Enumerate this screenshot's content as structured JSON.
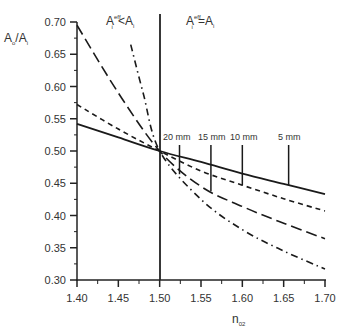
{
  "chart_data": {
    "type": "line",
    "title": "",
    "xlabel": "n02",
    "ylabel": "Ao/Ai",
    "xlim": [
      1.4,
      1.7
    ],
    "ylim": [
      0.3,
      0.7
    ],
    "x_ticks": [
      "1.40",
      "1.45",
      "1.50",
      "1.55",
      "1.60",
      "1.65",
      "1.70"
    ],
    "y_ticks": [
      "0.30",
      "0.35",
      "0.40",
      "0.45",
      "0.50",
      "0.55",
      "0.60",
      "0.65",
      "0.70"
    ],
    "grid": false,
    "region_labels": {
      "left": "Ai eff < Ai",
      "right": "Ai eff = Ai"
    },
    "vertical_line_x": 1.5,
    "series": [
      {
        "name": "5 mm",
        "style": "solid",
        "x": [
          1.4,
          1.45,
          1.5,
          1.55,
          1.6,
          1.65,
          1.7
        ],
        "values": [
          0.542,
          0.521,
          0.5,
          0.483,
          0.465,
          0.449,
          0.433
        ],
        "marker_n": 1.656
      },
      {
        "name": "10 mm",
        "style": "short-dash",
        "x": [
          1.4,
          1.45,
          1.5,
          1.55,
          1.6,
          1.65,
          1.7
        ],
        "values": [
          0.572,
          0.534,
          0.5,
          0.469,
          0.447,
          0.426,
          0.407
        ],
        "marker_n": 1.6
      },
      {
        "name": "15 mm",
        "style": "long-dash",
        "x": [
          1.4,
          1.45,
          1.5,
          1.55,
          1.6,
          1.65,
          1.7
        ],
        "values": [
          0.695,
          0.59,
          0.5,
          0.445,
          0.414,
          0.388,
          0.364
        ],
        "marker_n": 1.562
      },
      {
        "name": "20 mm",
        "style": "dash-dot",
        "x": [
          1.465,
          1.48,
          1.5,
          1.55,
          1.6,
          1.65,
          1.7
        ],
        "values": [
          0.665,
          0.59,
          0.5,
          0.425,
          0.378,
          0.345,
          0.317
        ],
        "marker_n": 1.524
      }
    ],
    "annotations": [
      "20 mm",
      "15 mm",
      "10 mm",
      "5 mm"
    ]
  },
  "labels": {
    "y_main": "A",
    "y_sub1": "o",
    "y_slash": "/A",
    "y_sub2": "i",
    "x_main": "n",
    "x_sub": "02",
    "left_A": "A",
    "left_sup": "eff",
    "left_sub": "i",
    "left_rest": "<A",
    "left_sub2": "i",
    "right_A": "A",
    "right_sup": "eff",
    "right_sub": "i",
    "right_rest": "=A",
    "right_sub2": "i",
    "mm20": "20 mm",
    "mm15": "15 mm",
    "mm10": "10 mm",
    "mm5": "5 mm"
  }
}
